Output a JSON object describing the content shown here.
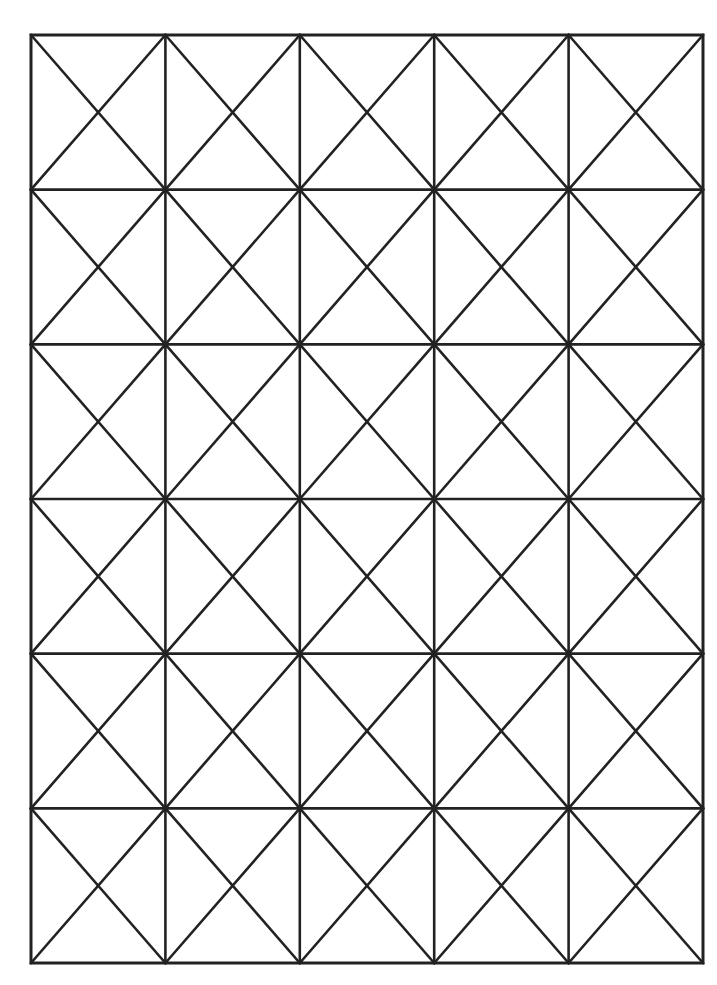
{
  "diagram": {
    "type": "grid-with-diagonals",
    "columns": 5,
    "rows": 6,
    "bounds": {
      "left": 31,
      "top": 35,
      "right": 703,
      "bottom": 963
    },
    "cell_pattern": "both-diagonals",
    "colors": {
      "background": "#ffffff",
      "line": "#222222"
    },
    "line_width": 2.6
  }
}
